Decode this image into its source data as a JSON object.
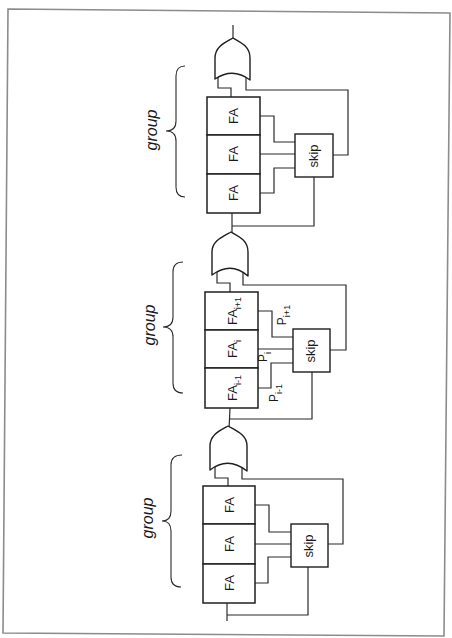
{
  "diagram": {
    "groups": [
      {
        "label": "group",
        "skip_label": "skip",
        "cells": [
          {
            "base": "FA",
            "sub": ""
          },
          {
            "base": "FA",
            "sub": ""
          },
          {
            "base": "FA",
            "sub": ""
          }
        ],
        "signals": []
      },
      {
        "label": "group",
        "skip_label": "skip",
        "cells": [
          {
            "base": "FA",
            "sub": "i+1"
          },
          {
            "base": "FA",
            "sub": "i"
          },
          {
            "base": "FA",
            "sub": "i-1"
          }
        ],
        "signals": [
          {
            "base": "P",
            "sub": "i+1"
          },
          {
            "base": "P",
            "sub": "i"
          },
          {
            "base": "P",
            "sub": "i-1"
          }
        ]
      },
      {
        "label": "group",
        "skip_label": "skip",
        "cells": [
          {
            "base": "FA",
            "sub": ""
          },
          {
            "base": "FA",
            "sub": ""
          },
          {
            "base": "FA",
            "sub": ""
          }
        ],
        "signals": []
      }
    ],
    "colors": {
      "line": "#2b2b2b",
      "frame": "#8c8c8c",
      "background": "#ffffff"
    }
  }
}
